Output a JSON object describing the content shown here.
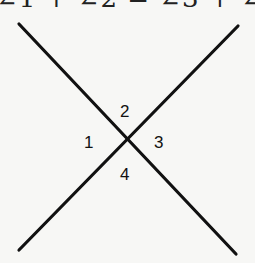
{
  "header_fragment": "∠1 + ∠2 = ∠3 + ∠4",
  "diagram": {
    "type": "intersecting-lines",
    "lines": [
      {
        "from": [
          19,
          24
        ],
        "to": [
          236,
          254
        ]
      },
      {
        "from": [
          238,
          26
        ],
        "to": [
          19,
          250
        ]
      }
    ],
    "angle_labels": {
      "left": "1",
      "top": "2",
      "right": "3",
      "bottom": "4"
    },
    "colors": {
      "line": "#111111",
      "background": "#f7f7f5"
    }
  }
}
